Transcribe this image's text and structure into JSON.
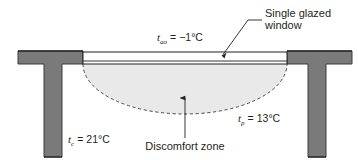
{
  "figure": {
    "name": "building-section-discomfort-zone",
    "background_color": "#ffffff"
  },
  "colors": {
    "wall": "#7a7a7a",
    "wall_edge": "#3b3b3b",
    "glazing_fill": "#ffffff",
    "glazing_stroke": "#231f20",
    "zone_fill": "#e9e9e9",
    "zone_dash": "#4a4a4a",
    "text": "#231f20",
    "leader": "#231f20"
  },
  "callouts": {
    "window": {
      "line1": "Single glazed",
      "line2": "window"
    },
    "discomfort": {
      "label": "Discomfort zone"
    }
  },
  "temperatures": [
    {
      "id": "outdoor-air",
      "symbol": "t",
      "subscript": "ao",
      "equals": "=",
      "value": "−1°C",
      "full": "t_ao = −1°C"
    },
    {
      "id": "pane-surface",
      "symbol": "t",
      "subscript": "p",
      "equals": "=",
      "value": "13°C",
      "full": "t_p = 13°C"
    },
    {
      "id": "indoor-core",
      "symbol": "t",
      "subscript": "c",
      "equals": "=",
      "value": "21°C",
      "full": "t_c = 21°C"
    }
  ]
}
